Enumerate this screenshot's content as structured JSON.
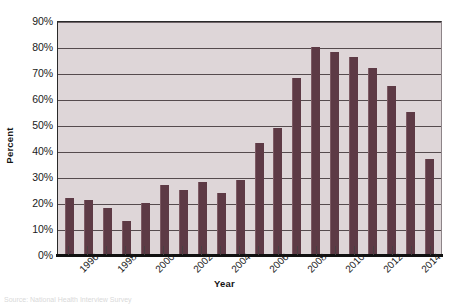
{
  "axes": {
    "ylabel": "Percent",
    "xlabel": "Year",
    "yticks": [
      "90%",
      "80%",
      "70%",
      "60%",
      "50%",
      "40%",
      "30%",
      "20%",
      "10%",
      "0%"
    ]
  },
  "source_note": "Source: National Health Interview Survey",
  "colors": {
    "bar": "#5d3a45",
    "bar_highlight": "#7d5b64",
    "plot_background": "#ded6d8",
    "gridline": "#3d3236",
    "axis": "#111111",
    "text": "#1a1a1a"
  },
  "chart_data": {
    "type": "bar",
    "title": "",
    "xlabel": "Year",
    "ylabel": "Percent",
    "ylim": [
      0,
      90
    ],
    "ytick_values": [
      0,
      10,
      20,
      30,
      40,
      50,
      60,
      70,
      80,
      90
    ],
    "ytick_labels": [
      "0%",
      "10%",
      "20%",
      "30%",
      "40%",
      "50%",
      "60%",
      "70%",
      "80%",
      "90%"
    ],
    "grid": true,
    "legend": null,
    "categories": [
      "1995",
      "1996",
      "1997",
      "1998",
      "1999",
      "2000",
      "2001",
      "2002",
      "2003",
      "2004",
      "2005",
      "2006",
      "2007",
      "2008",
      "2009",
      "2010",
      "2011",
      "2012",
      "2013",
      "2014"
    ],
    "visible_tick_labels": [
      "",
      "1996",
      "",
      "1998",
      "",
      "2000",
      "",
      "2002",
      "",
      "2004",
      "",
      "2006",
      "",
      "2008",
      "",
      "2010",
      "",
      "2012",
      "",
      "2014"
    ],
    "values": [
      22,
      21,
      18,
      13,
      20,
      27,
      25,
      28,
      24,
      29,
      43,
      49,
      68,
      80,
      78,
      76,
      72,
      65,
      55,
      37
    ]
  }
}
